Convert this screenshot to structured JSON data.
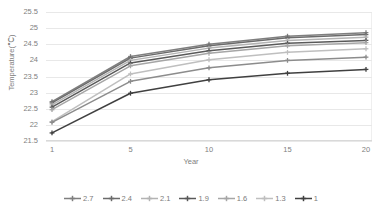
{
  "chart_data": {
    "type": "line",
    "title": "",
    "xlabel": "Year",
    "ylabel": "Temperature(℃)",
    "x": [
      1,
      5,
      10,
      15,
      20
    ],
    "xtick_labels": [
      "1",
      "5",
      "10",
      "15",
      "20"
    ],
    "ytick_labels": [
      "21.5",
      "22",
      "22.5",
      "23",
      "23.5",
      "24",
      "24.5",
      "25",
      "25.5"
    ],
    "ytick_values": [
      21.5,
      22,
      22.5,
      23,
      23.5,
      24,
      24.5,
      25,
      25.5
    ],
    "ylim": [
      21.5,
      25.5
    ],
    "grid": true,
    "legend_position": "bottom",
    "series": [
      {
        "name": "2.7",
        "color": "#7f7f7f",
        "values": [
          22.72,
          24.12,
          24.5,
          24.75,
          24.86
        ]
      },
      {
        "name": "2.4",
        "color": "#6b6b6b",
        "values": [
          22.68,
          24.07,
          24.45,
          24.7,
          24.8
        ]
      },
      {
        "name": "2.1",
        "color": "#b3b3b3",
        "values": [
          22.62,
          24.0,
          24.38,
          24.62,
          24.72
        ]
      },
      {
        "name": "1.9",
        "color": "#595959",
        "values": [
          22.55,
          23.92,
          24.3,
          24.53,
          24.62
        ]
      },
      {
        "name": "1.6",
        "color": "#a6a6a6",
        "values": [
          22.47,
          23.83,
          24.22,
          24.45,
          24.55
        ]
      },
      {
        "name": "1.3",
        "color": "#bfbfbf",
        "values": [
          22.1,
          23.58,
          24.02,
          24.25,
          24.36
        ]
      },
      {
        "name": "1",
        "color": "#8c8c8c",
        "values": [
          22.08,
          23.35,
          23.77,
          24.0,
          24.1
        ]
      }
    ],
    "series_lowest": {
      "name": "1",
      "color": "#404040",
      "values": [
        21.75,
        22.98,
        23.4,
        23.6,
        23.72
      ]
    }
  },
  "legend": {
    "entries": [
      "2.7",
      "2.4",
      "2.1",
      "1.9",
      "1.6",
      "1.3",
      "1"
    ]
  },
  "axes": {
    "x_title": "Year",
    "y_title": "Temperature(℃)"
  }
}
